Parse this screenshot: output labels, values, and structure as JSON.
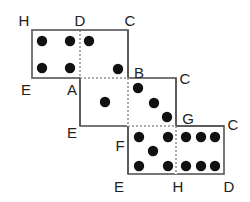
{
  "figure": {
    "line_color": "#555555",
    "dot_color": "#111111"
  },
  "dominoes": [
    {
      "name": "top",
      "rect": [
        32,
        30,
        96,
        48
      ],
      "divider_x": 80,
      "dashed_edges": [
        [
          80,
          78,
          128,
          78
        ]
      ],
      "dots": [
        [
          42,
          41
        ],
        [
          70,
          41
        ],
        [
          89,
          41
        ],
        [
          42,
          68
        ],
        [
          70,
          68
        ],
        [
          118,
          69
        ]
      ],
      "left_half_pips": 4,
      "right_half_pips": 2
    },
    {
      "name": "middle",
      "rect": [
        80,
        78,
        96,
        48
      ],
      "divider_x": 128,
      "dots": [
        [
          105,
          102
        ],
        [
          138,
          88
        ],
        [
          154,
          103
        ],
        [
          167,
          117
        ]
      ],
      "left_half_pips": 1,
      "right_half_pips": 3
    },
    {
      "name": "bottom",
      "rect": [
        128,
        126,
        96,
        48
      ],
      "divider_x": 176,
      "dashed_edges": [
        [
          128,
          126,
          176,
          126
        ]
      ],
      "dots": [
        [
          139,
          137
        ],
        [
          168,
          137
        ],
        [
          186,
          137
        ],
        [
          201,
          137
        ],
        [
          215,
          137
        ],
        [
          153,
          151
        ],
        [
          139,
          166
        ],
        [
          168,
          166
        ],
        [
          186,
          166
        ],
        [
          201,
          166
        ],
        [
          215,
          166
        ]
      ],
      "left_half_pips": 5,
      "right_half_pips": 6
    }
  ],
  "labels": [
    {
      "text": "H",
      "x": 24,
      "y": 20
    },
    {
      "text": "D",
      "x": 80,
      "y": 20
    },
    {
      "text": "C",
      "x": 130,
      "y": 20
    },
    {
      "text": "E",
      "x": 26,
      "y": 89
    },
    {
      "text": "A",
      "x": 72,
      "y": 89
    },
    {
      "text": "B",
      "x": 139,
      "y": 72
    },
    {
      "text": "C",
      "x": 185,
      "y": 78
    },
    {
      "text": "E",
      "x": 72,
      "y": 132
    },
    {
      "text": "F",
      "x": 120,
      "y": 145
    },
    {
      "text": "G",
      "x": 188,
      "y": 118
    },
    {
      "text": "C",
      "x": 233,
      "y": 124
    },
    {
      "text": "E",
      "x": 119,
      "y": 186
    },
    {
      "text": "H",
      "x": 178,
      "y": 186
    },
    {
      "text": "D",
      "x": 229,
      "y": 186
    }
  ]
}
